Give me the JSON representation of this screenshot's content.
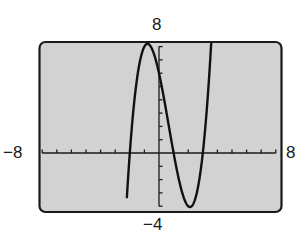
{
  "chart_data": {
    "type": "line",
    "title": "",
    "xlabel": "",
    "ylabel": "",
    "xlim": [
      -8,
      8
    ],
    "ylim": [
      -4,
      8
    ],
    "xscl": 1,
    "yscl": 1,
    "grid": false,
    "window_labels": {
      "xmin": "−8",
      "xmax": "8",
      "ymin": "−4",
      "ymax": "8"
    },
    "function": "f(x) = (x + 2)(x − 1)(x − 3) = x^3 − 2x^2 − 5x + 6",
    "series": [
      {
        "name": "f(x)",
        "x": [
          -2.2,
          -2.0,
          -1.5,
          -1.0,
          -0.79,
          -0.5,
          0.0,
          0.5,
          1.0,
          1.5,
          2.0,
          2.12,
          2.5,
          3.0,
          3.5,
          3.75
        ],
        "values": [
          -4.05,
          0.0,
          5.63,
          8.0,
          8.21,
          7.88,
          6.0,
          3.13,
          0.0,
          -2.63,
          -4.0,
          -4.06,
          -3.38,
          0.0,
          6.88,
          12.0
        ]
      }
    ],
    "zeros": [
      -2,
      1,
      3
    ],
    "y_intercept": 6,
    "local_max": {
      "x": -0.79,
      "y": 8.21
    },
    "local_min": {
      "x": 2.12,
      "y": -4.06
    }
  },
  "screen": {
    "background": "#d2d2d2",
    "border": "#1a1a1a",
    "curve_color": "#111111"
  }
}
